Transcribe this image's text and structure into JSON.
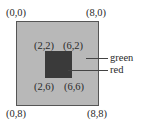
{
  "diagram": {
    "outer_region": {
      "name": "green",
      "fill": "#b8b8b8",
      "corners": {
        "top_left": "(0,0)",
        "top_right": "(8,0)",
        "bottom_left": "(0,8)",
        "bottom_right": "(8,8)"
      }
    },
    "inner_region": {
      "name": "red",
      "fill": "#3a3a3a",
      "corners": {
        "top_left": "(2,2)",
        "top_right": "(6,2)",
        "bottom_left": "(2,6)",
        "bottom_right": "(6,6)"
      }
    },
    "legend": {
      "outer_label": "green",
      "inner_label": "red"
    }
  }
}
